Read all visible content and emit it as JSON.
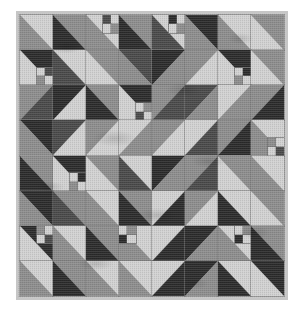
{
  "artwork": {
    "title": "Half-Square Triangle Patchwork Quilt",
    "kind": "quilt-photograph",
    "grid_rows": 8,
    "grid_columns": 8,
    "block_type": "half-square-triangle",
    "border_label": "light gray sashing border"
  },
  "palette": {
    "light": "#d2d2d2",
    "light_alt": "#c2c2c2",
    "mid": "#8d8d8d",
    "mid_dark": "#6f6f6f",
    "dark": "#4a4a4a",
    "darkest": "#2b2b2b",
    "border": "#c6c6c6",
    "background": "#ffffff",
    "seam": "#7a7a7a"
  },
  "blocks": [
    {
      "r": 0,
      "c": 0,
      "d": "nwse",
      "a": "light",
      "b": "mid"
    },
    {
      "r": 0,
      "c": 1,
      "d": "nwse",
      "a": "mid",
      "b": "darkest"
    },
    {
      "r": 0,
      "c": 2,
      "d": "nwse",
      "a": "light",
      "b": "mid",
      "fp": {
        "pos": "fp-tr",
        "cells": [
          "dark",
          "light",
          "light",
          "mid"
        ]
      }
    },
    {
      "r": 0,
      "c": 3,
      "d": "nwse",
      "a": "mid",
      "b": "darkest"
    },
    {
      "r": 0,
      "c": 4,
      "d": "nwse",
      "a": "light",
      "b": "dark",
      "fp": {
        "pos": "fp-tr",
        "cells": [
          "darkest",
          "light",
          "light",
          "mid"
        ]
      }
    },
    {
      "r": 0,
      "c": 5,
      "d": "nwse",
      "a": "darkest",
      "b": "mid"
    },
    {
      "r": 0,
      "c": 6,
      "d": "nwse",
      "a": "light",
      "b": "mid"
    },
    {
      "r": 0,
      "c": 7,
      "d": "nwse",
      "a": "mid",
      "b": "light"
    },
    {
      "r": 1,
      "c": 0,
      "d": "nwse",
      "a": "darkest",
      "b": "light",
      "fp": {
        "pos": "fp-br",
        "cells": [
          "light",
          "dark",
          "mid",
          "light"
        ]
      }
    },
    {
      "r": 1,
      "c": 1,
      "d": "nwse",
      "a": "light",
      "b": "dark"
    },
    {
      "r": 1,
      "c": 2,
      "d": "nwse",
      "a": "mid",
      "b": "light"
    },
    {
      "r": 1,
      "c": 3,
      "d": "nwse",
      "a": "dark",
      "b": "mid"
    },
    {
      "r": 1,
      "c": 4,
      "d": "swne",
      "a": "darkest",
      "b": "mid"
    },
    {
      "r": 1,
      "c": 5,
      "d": "nesw",
      "a": "mid",
      "b": "light"
    },
    {
      "r": 1,
      "c": 6,
      "d": "nwse",
      "a": "darkest",
      "b": "light",
      "fp": {
        "pos": "fp-br",
        "cells": [
          "light",
          "darkest",
          "mid",
          "light"
        ]
      }
    },
    {
      "r": 1,
      "c": 7,
      "d": "nwse",
      "a": "mid",
      "b": "light"
    },
    {
      "r": 2,
      "c": 0,
      "d": "swne",
      "a": "mid",
      "b": "dark"
    },
    {
      "r": 2,
      "c": 1,
      "d": "swne",
      "a": "darkest",
      "b": "light"
    },
    {
      "r": 2,
      "c": 2,
      "d": "nwse",
      "a": "mid",
      "b": "darkest"
    },
    {
      "r": 2,
      "c": 3,
      "d": "nwse",
      "a": "darkest",
      "b": "light",
      "fp": {
        "pos": "fp-br",
        "cells": [
          "light",
          "mid",
          "dark",
          "light"
        ]
      }
    },
    {
      "r": 2,
      "c": 4,
      "d": "nesw",
      "a": "mid",
      "b": "dark"
    },
    {
      "r": 2,
      "c": 5,
      "d": "nesw",
      "a": "dark",
      "b": "mid"
    },
    {
      "r": 2,
      "c": 6,
      "d": "nesw",
      "a": "light",
      "b": "mid"
    },
    {
      "r": 2,
      "c": 7,
      "d": "nesw",
      "a": "mid",
      "b": "darkest"
    },
    {
      "r": 3,
      "c": 0,
      "d": "nwse",
      "a": "darkest",
      "b": "mid"
    },
    {
      "r": 3,
      "c": 1,
      "d": "nesw",
      "a": "dark",
      "b": "light"
    },
    {
      "r": 3,
      "c": 2,
      "d": "swne",
      "a": "mid",
      "b": "light"
    },
    {
      "r": 3,
      "c": 3,
      "d": "swne",
      "a": "light",
      "b": "mid"
    },
    {
      "r": 3,
      "c": 4,
      "d": "nesw",
      "a": "mid",
      "b": "light"
    },
    {
      "r": 3,
      "c": 5,
      "d": "nesw",
      "a": "light",
      "b": "dark"
    },
    {
      "r": 3,
      "c": 6,
      "d": "nesw",
      "a": "mid",
      "b": "darkest"
    },
    {
      "r": 3,
      "c": 7,
      "d": "nwse",
      "a": "light",
      "b": "mid",
      "fp": {
        "pos": "fp-br",
        "cells": [
          "mid",
          "light",
          "light",
          "dark"
        ]
      }
    },
    {
      "r": 4,
      "c": 0,
      "d": "nwse",
      "a": "mid",
      "b": "darkest"
    },
    {
      "r": 4,
      "c": 1,
      "d": "nwse",
      "a": "darkest",
      "b": "light",
      "fp": {
        "pos": "fp-br",
        "cells": [
          "light",
          "darkest",
          "mid",
          "light"
        ]
      }
    },
    {
      "r": 4,
      "c": 2,
      "d": "nwse",
      "a": "mid",
      "b": "light"
    },
    {
      "r": 4,
      "c": 3,
      "d": "nwse",
      "a": "light",
      "b": "dark"
    },
    {
      "r": 4,
      "c": 4,
      "d": "swne",
      "a": "darkest",
      "b": "mid"
    },
    {
      "r": 4,
      "c": 5,
      "d": "swne",
      "a": "mid",
      "b": "dark"
    },
    {
      "r": 4,
      "c": 6,
      "d": "nwse",
      "a": "mid",
      "b": "light"
    },
    {
      "r": 4,
      "c": 7,
      "d": "nwse",
      "a": "light",
      "b": "mid"
    },
    {
      "r": 5,
      "c": 0,
      "d": "nwse",
      "a": "darkest",
      "b": "mid"
    },
    {
      "r": 5,
      "c": 1,
      "d": "nwse",
      "a": "mid",
      "b": "dark"
    },
    {
      "r": 5,
      "c": 2,
      "d": "nwse",
      "a": "light",
      "b": "mid"
    },
    {
      "r": 5,
      "c": 3,
      "d": "nwse",
      "a": "mid",
      "b": "darkest"
    },
    {
      "r": 5,
      "c": 4,
      "d": "swne",
      "a": "light",
      "b": "darkest"
    },
    {
      "r": 5,
      "c": 5,
      "d": "swne",
      "a": "mid",
      "b": "light"
    },
    {
      "r": 5,
      "c": 6,
      "d": "nwse",
      "a": "light",
      "b": "darkest"
    },
    {
      "r": 5,
      "c": 7,
      "d": "nwse",
      "a": "mid",
      "b": "light"
    },
    {
      "r": 6,
      "c": 0,
      "d": "nwse",
      "a": "darkest",
      "b": "light",
      "fp": {
        "pos": "fp-tr",
        "cells": [
          "mid",
          "light",
          "light",
          "dark"
        ]
      }
    },
    {
      "r": 6,
      "c": 1,
      "d": "nwse",
      "a": "light",
      "b": "mid"
    },
    {
      "r": 6,
      "c": 2,
      "d": "nwse",
      "a": "mid",
      "b": "darkest"
    },
    {
      "r": 6,
      "c": 3,
      "d": "nwse",
      "a": "light",
      "b": "mid",
      "fp": {
        "pos": "fp-tl",
        "cells": [
          "light",
          "mid",
          "darkest",
          "light"
        ]
      }
    },
    {
      "r": 6,
      "c": 4,
      "d": "swne",
      "a": "light",
      "b": "darkest"
    },
    {
      "r": 6,
      "c": 5,
      "d": "swne",
      "a": "darkest",
      "b": "mid"
    },
    {
      "r": 6,
      "c": 6,
      "d": "nwse",
      "a": "light",
      "b": "mid",
      "fp": {
        "pos": "fp-tr",
        "cells": [
          "light",
          "mid",
          "darkest",
          "light"
        ]
      }
    },
    {
      "r": 6,
      "c": 7,
      "d": "nwse",
      "a": "mid",
      "b": "darkest"
    },
    {
      "r": 7,
      "c": 0,
      "d": "nwse",
      "a": "light",
      "b": "mid"
    },
    {
      "r": 7,
      "c": 1,
      "d": "nwse",
      "a": "mid",
      "b": "darkest"
    },
    {
      "r": 7,
      "c": 2,
      "d": "nwse",
      "a": "light",
      "b": "mid"
    },
    {
      "r": 7,
      "c": 3,
      "d": "nwse",
      "a": "light",
      "b": "mid"
    },
    {
      "r": 7,
      "c": 4,
      "d": "swne",
      "a": "light",
      "b": "darkest"
    },
    {
      "r": 7,
      "c": 5,
      "d": "swne",
      "a": "darkest",
      "b": "mid"
    },
    {
      "r": 7,
      "c": 6,
      "d": "nwse",
      "a": "light",
      "b": "darkest"
    },
    {
      "r": 7,
      "c": 7,
      "d": "nwse",
      "a": "darkest",
      "b": "light"
    }
  ]
}
